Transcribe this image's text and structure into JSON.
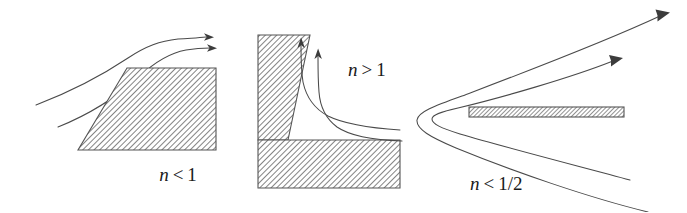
{
  "figure": {
    "background_color": "#ffffff",
    "line_color": "#4a4a4a",
    "hatch_color": "#6e6e6e",
    "label_color": "#1a1a1a",
    "width": 687,
    "height": 212
  },
  "panels": [
    {
      "id": "panel-left",
      "name": "expanding-wedge-panel",
      "label": {
        "variable": "n",
        "relation": "<",
        "value": "1",
        "full_text": "n < 1",
        "x": 178,
        "y": 181
      },
      "body": {
        "name": "hatched-trapezoid",
        "shape": "trapezoid",
        "points": "127,68 216,68 216,150 78,150",
        "hatched": true
      },
      "streamlines": [
        {
          "name": "streamline-outer",
          "arrow": true,
          "arrow_direction": "right"
        },
        {
          "name": "streamline-inner",
          "arrow": true,
          "arrow_direction": "right"
        }
      ]
    },
    {
      "id": "panel-middle",
      "name": "reentrant-corner-panel",
      "label": {
        "variable": "n",
        "relation": ">",
        "value": "1",
        "full_text": "n > 1",
        "x": 348,
        "y": 76
      },
      "body": {
        "name": "hatched-corner",
        "shape": "L-corner",
        "upper_block_points": "258,35 310,35 288,140 258,140",
        "lower_block_points": "258,140 400,140 400,188 258,188",
        "hatched": true
      },
      "streamlines": [
        {
          "name": "streamline-outer",
          "arrow": true,
          "arrow_direction": "up"
        },
        {
          "name": "streamline-inner",
          "arrow": true,
          "arrow_direction": "up"
        }
      ]
    },
    {
      "id": "panel-right",
      "name": "flat-plate-panel",
      "label": {
        "variable": "n",
        "relation": "<",
        "value": "1/2",
        "full_text": "n < 1/2",
        "x": 470,
        "y": 190
      },
      "body": {
        "name": "hatched-plate",
        "shape": "thin-bar",
        "x": 469,
        "y": 107,
        "width": 155,
        "height": 10,
        "hatched": true
      },
      "streamlines": [
        {
          "name": "streamline-outer-parabola",
          "arrow": true,
          "arrow_direction": "up-right"
        },
        {
          "name": "streamline-inner-parabola",
          "arrow": true,
          "arrow_direction": "up-right"
        }
      ]
    }
  ]
}
